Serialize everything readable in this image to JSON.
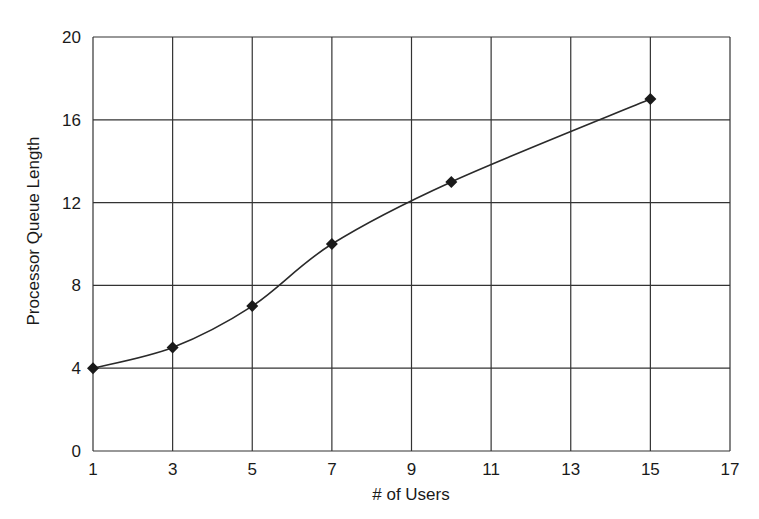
{
  "chart_data": {
    "type": "line",
    "title": "",
    "xlabel": "# of Users",
    "ylabel": "Processor Queue Length",
    "xlim": [
      1,
      17
    ],
    "ylim": [
      0,
      20
    ],
    "x_ticks": [
      1,
      3,
      5,
      7,
      9,
      11,
      13,
      15,
      17
    ],
    "y_ticks": [
      0,
      4,
      8,
      12,
      16,
      20
    ],
    "grid": true,
    "legend": null,
    "series": [
      {
        "name": "Processor Queue Length",
        "marker": "diamond",
        "smooth": true,
        "x": [
          1,
          3,
          5,
          7,
          10,
          15
        ],
        "values": [
          4,
          5,
          7,
          10,
          13,
          17
        ]
      }
    ]
  },
  "colors": {
    "line": "#2a2a2a",
    "marker": "#1a1a1a",
    "grid": "#333333",
    "background": "#ffffff"
  }
}
